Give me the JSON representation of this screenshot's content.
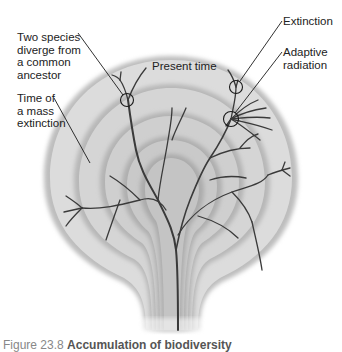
{
  "figure": {
    "type": "phylogenetic-tree-diagram",
    "labels": {
      "diverge": "Two species\ndiverge from\na common\nancestor",
      "present_time": "Present time",
      "extinction": "Extinction",
      "adaptive_radiation": "Adaptive\nradiation",
      "mass_extinction": "Time of\na mass\nextinction"
    },
    "caption": {
      "number": "Figure 23.8",
      "title": "Accumulation of biodiversity"
    },
    "colors": {
      "background": "#ffffff",
      "outer_ring": "#d9d9d9",
      "inner_ring": "#c8c8c8",
      "branches": "#3a3a3a",
      "text": "#222222"
    }
  }
}
